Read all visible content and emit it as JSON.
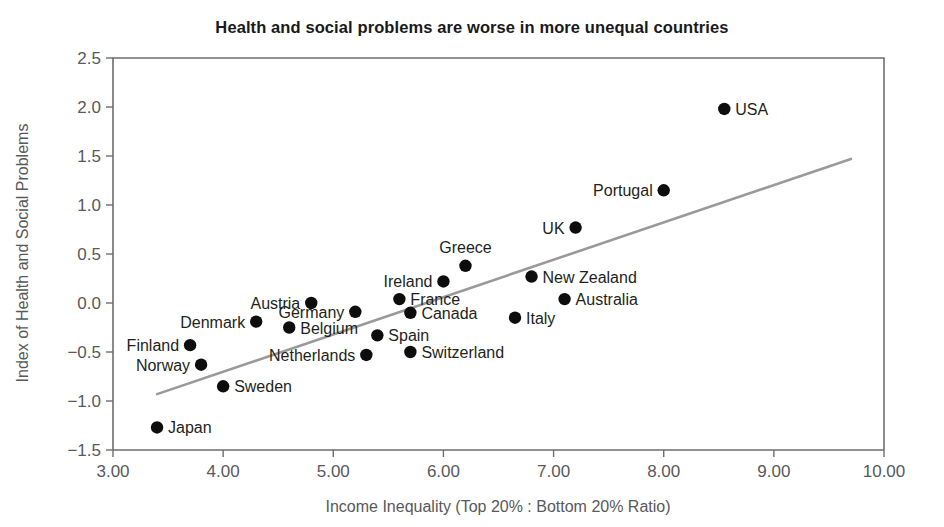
{
  "chart_data": {
    "type": "scatter",
    "title": "Health and social problems are worse in more unequal countries",
    "xlabel": "Income Inequality (Top 20% : Bottom 20% Ratio)",
    "ylabel": "Index of Health and Social Problems",
    "xlim": [
      3.0,
      10.0
    ],
    "ylim": [
      -1.5,
      2.5
    ],
    "grid": false,
    "legend": "none",
    "xticks": [
      "3.00",
      "4.00",
      "5.00",
      "6.00",
      "7.00",
      "8.00",
      "9.00",
      "10.00"
    ],
    "xtick_values": [
      3,
      4,
      5,
      6,
      7,
      8,
      9,
      10
    ],
    "yticks": [
      "2.5",
      "2.0",
      "1.5",
      "1.0",
      "0.5",
      "0.0",
      "-0.5",
      "-1.0",
      "-1.5"
    ],
    "ytick_values": [
      2.5,
      2.0,
      1.5,
      1.0,
      0.5,
      0.0,
      -0.5,
      -1.0,
      -1.5
    ],
    "points": [
      {
        "label": "Japan",
        "x": 3.4,
        "y": -1.27,
        "label_pos": "right"
      },
      {
        "label": "Finland",
        "x": 3.7,
        "y": -0.43,
        "label_pos": "left"
      },
      {
        "label": "Norway",
        "x": 3.8,
        "y": -0.63,
        "label_pos": "left"
      },
      {
        "label": "Sweden",
        "x": 4.0,
        "y": -0.85,
        "label_pos": "right"
      },
      {
        "label": "Denmark",
        "x": 4.3,
        "y": -0.19,
        "label_pos": "left"
      },
      {
        "label": "Belgium",
        "x": 4.6,
        "y": -0.25,
        "label_pos": "right"
      },
      {
        "label": "Austria",
        "x": 4.8,
        "y": 0.0,
        "label_pos": "left"
      },
      {
        "label": "Germany",
        "x": 5.2,
        "y": -0.09,
        "label_pos": "left"
      },
      {
        "label": "Netherlands",
        "x": 5.3,
        "y": -0.53,
        "label_pos": "left"
      },
      {
        "label": "Spain",
        "x": 5.4,
        "y": -0.33,
        "label_pos": "right"
      },
      {
        "label": "France",
        "x": 5.6,
        "y": 0.04,
        "label_pos": "right"
      },
      {
        "label": "Canada",
        "x": 5.7,
        "y": -0.1,
        "label_pos": "right"
      },
      {
        "label": "Switzerland",
        "x": 5.7,
        "y": -0.5,
        "label_pos": "right"
      },
      {
        "label": "Ireland",
        "x": 6.0,
        "y": 0.22,
        "label_pos": "left"
      },
      {
        "label": "Greece",
        "x": 6.2,
        "y": 0.38,
        "label_pos": "above"
      },
      {
        "label": "Italy",
        "x": 6.65,
        "y": -0.15,
        "label_pos": "right"
      },
      {
        "label": "New Zealand",
        "x": 6.8,
        "y": 0.27,
        "label_pos": "right"
      },
      {
        "label": "Australia",
        "x": 7.1,
        "y": 0.04,
        "label_pos": "right"
      },
      {
        "label": "UK",
        "x": 7.2,
        "y": 0.77,
        "label_pos": "left"
      },
      {
        "label": "Portugal",
        "x": 8.0,
        "y": 1.15,
        "label_pos": "left"
      },
      {
        "label": "USA",
        "x": 8.55,
        "y": 1.98,
        "label_pos": "right"
      }
    ],
    "trend_line": {
      "x0": 3.4,
      "y0": -0.93,
      "x1": 9.7,
      "y1": 1.47
    }
  },
  "colors": {
    "dot": "#0d0d0d",
    "trend": "#9a9a9a",
    "axis": "#6d6e71",
    "label": "#231f20",
    "tick": "#58595b",
    "background": "#ffffff"
  }
}
